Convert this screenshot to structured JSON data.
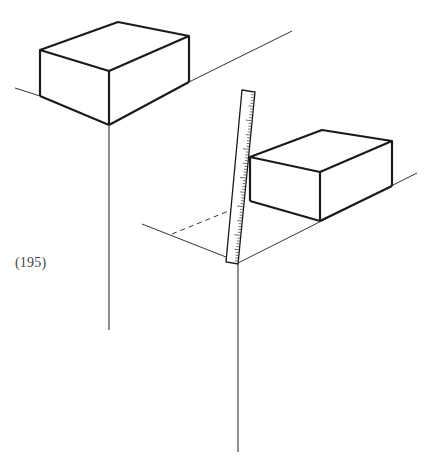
{
  "figure": {
    "label": "(195)",
    "colors": {
      "ink": "#1a1a1a",
      "thin_line": "#333333",
      "label": "#444444",
      "background": "#ffffff"
    },
    "elements": [
      "box-upper-left",
      "ground-line-upper",
      "vertical-line-upper",
      "box-lower-right",
      "ground-line-lower-right",
      "ground-line-lower-left",
      "dashed-construction-line",
      "ruler",
      "vertical-line-lower"
    ]
  }
}
